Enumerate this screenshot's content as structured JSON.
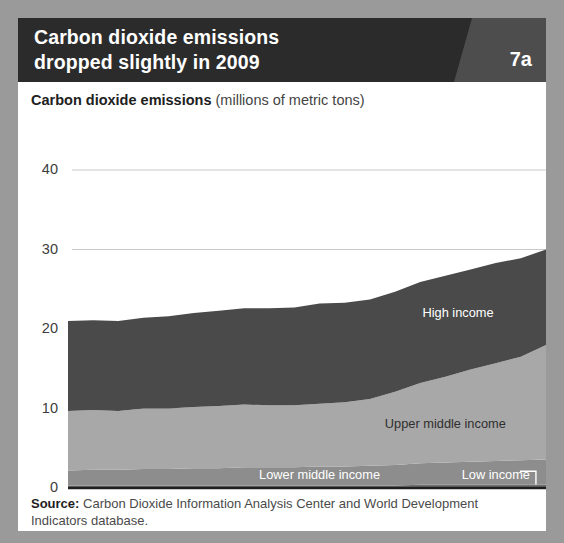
{
  "header": {
    "title_line1": "Carbon dioxide emissions",
    "title_line2": "dropped slightly in 2009",
    "badge": "7a",
    "bar_color": "#2b2b2b",
    "wedge_color": "#4d4d4d"
  },
  "subtitle": {
    "strong": "Carbon dioxide emissions",
    "unit": " (millions of metric tons)"
  },
  "source": {
    "strong": "Source:",
    "text": " Carbon Dioxide Information Analysis Center and World Development Indicators database."
  },
  "chart_data": {
    "type": "area",
    "stacked": true,
    "title": "Carbon dioxide emissions dropped slightly in 2009",
    "subtitle": "Carbon dioxide emissions (millions of metric tons)",
    "xlabel": "",
    "ylabel": "",
    "ylim": [
      0,
      40
    ],
    "xlim": [
      1990,
      2009
    ],
    "grid": true,
    "legend_position": "inline",
    "y_ticks": [
      0,
      10,
      20,
      30,
      40
    ],
    "x_ticks": [
      1990,
      1995,
      2000,
      2005,
      2009
    ],
    "x": [
      1990,
      1991,
      1992,
      1993,
      1994,
      1995,
      1996,
      1997,
      1998,
      1999,
      2000,
      2001,
      2002,
      2003,
      2004,
      2005,
      2006,
      2007,
      2008,
      2009
    ],
    "series": [
      {
        "name": "Low income",
        "color": "#6f6f6f",
        "values": [
          0.3,
          0.3,
          0.3,
          0.3,
          0.3,
          0.3,
          0.3,
          0.3,
          0.3,
          0.3,
          0.3,
          0.3,
          0.3,
          0.3,
          0.4,
          0.4,
          0.4,
          0.4,
          0.4,
          0.4
        ]
      },
      {
        "name": "Lower middle income",
        "color": "#8d8d8d",
        "values": [
          1.9,
          2.0,
          2.0,
          2.1,
          2.1,
          2.2,
          2.2,
          2.3,
          2.3,
          2.3,
          2.4,
          2.4,
          2.5,
          2.6,
          2.7,
          2.8,
          2.9,
          3.0,
          3.1,
          3.2
        ]
      },
      {
        "name": "Upper middle income",
        "color": "#a8a8a8",
        "values": [
          7.5,
          7.5,
          7.4,
          7.6,
          7.6,
          7.7,
          7.8,
          7.9,
          7.8,
          7.8,
          7.9,
          8.1,
          8.4,
          9.2,
          10.1,
          10.8,
          11.6,
          12.3,
          13.0,
          14.4
        ]
      },
      {
        "name": "High income",
        "color": "#4a4a4a",
        "values": [
          11.3,
          11.3,
          11.3,
          11.4,
          11.6,
          11.8,
          12.0,
          12.1,
          12.2,
          12.3,
          12.6,
          12.5,
          12.5,
          12.6,
          12.7,
          12.7,
          12.6,
          12.6,
          12.4,
          12.0
        ]
      }
    ],
    "totals": [
      21.0,
      21.1,
      21.0,
      21.4,
      21.6,
      22.0,
      22.3,
      22.6,
      22.6,
      22.7,
      23.2,
      23.3,
      23.7,
      24.7,
      25.9,
      26.7,
      27.5,
      28.3,
      28.9,
      30.0
    ],
    "annotations": [
      {
        "label": "High income",
        "x": 2005.5,
        "y": 22.0
      },
      {
        "label": "Upper middle income",
        "x": 2005.0,
        "y": 8.0
      },
      {
        "label": "Lower middle income",
        "x": 2000.0,
        "y": 1.6
      },
      {
        "label": "Low income",
        "x": 2007.0,
        "y": 1.6
      }
    ]
  }
}
